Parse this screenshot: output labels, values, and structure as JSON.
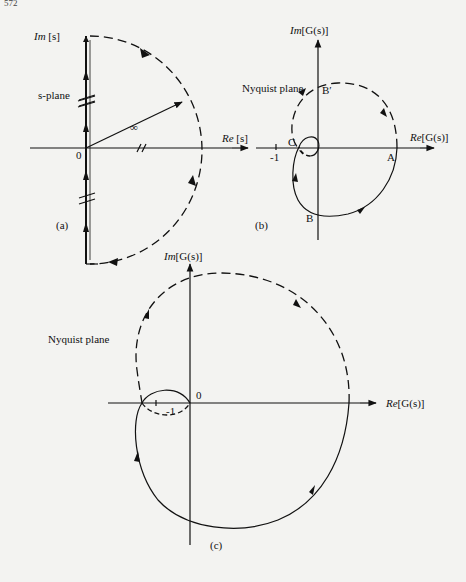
{
  "page": {
    "number": "572"
  },
  "panel_a": {
    "caption": "(a)",
    "plane_label": "s-plane",
    "im_axis_label_italic": "Im",
    "im_axis_label_rest": " [s]",
    "re_axis_label_italic": "Re",
    "re_axis_label_rest": " [s]",
    "origin_label": "0",
    "radius_label": "∞"
  },
  "panel_b": {
    "caption": "(b)",
    "plane_label": "Nyquist plane",
    "im_axis_label_italic": "Im",
    "im_axis_label_rest": "[G(s)]",
    "re_axis_label_italic": "Re",
    "re_axis_label_rest": "[G(s)]",
    "minus_one_label": "-1",
    "points": {
      "A": "A",
      "B": "B",
      "B_prime": "B′",
      "C": "C"
    }
  },
  "panel_c": {
    "caption": "(c)",
    "plane_label": "Nyquist plane",
    "im_axis_label_italic": "Im",
    "im_axis_label_rest": "[G(s)]",
    "re_axis_label_italic": "Re",
    "re_axis_label_rest": "[G(s)]",
    "origin_label": "0",
    "minus_one_label": "-1"
  }
}
